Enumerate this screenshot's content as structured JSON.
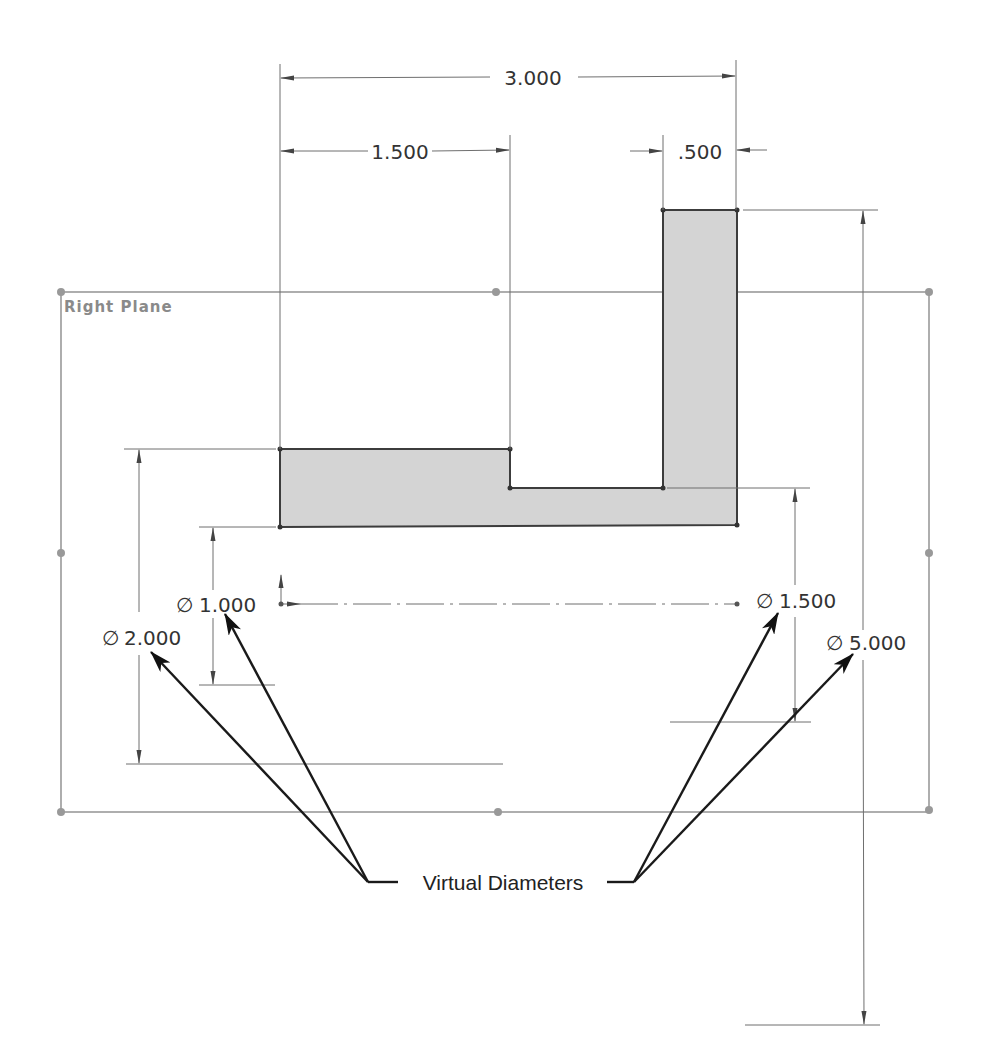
{
  "sketch": {
    "plane_label": "Right Plane",
    "profile_fill": "#d4d4d4",
    "profile_stroke": "#3c3c3c",
    "plane_color": "#8c8c8c"
  },
  "dimensions": {
    "horizontal": [
      {
        "id": "overall-width",
        "text": "3.000"
      },
      {
        "id": "left-flange-width",
        "text": "1.500"
      },
      {
        "id": "right-wall-thickness",
        "text": ".500"
      }
    ],
    "diameters": [
      {
        "id": "dia-1",
        "symbol": "∅",
        "value": "1.000"
      },
      {
        "id": "dia-2",
        "symbol": "∅",
        "value": "2.000"
      },
      {
        "id": "dia-3",
        "symbol": "∅",
        "value": "1.500"
      },
      {
        "id": "dia-4",
        "symbol": "∅",
        "value": "5.000"
      }
    ]
  },
  "callout": {
    "label": "Virtual Diameters"
  }
}
